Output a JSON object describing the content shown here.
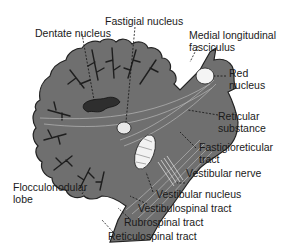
{
  "figure": {
    "type": "anatomical-diagram",
    "colors": {
      "tissue": "#6f6f6f",
      "tissue_dark": "#3a3a3a",
      "outline": "#222222",
      "nucleus_fill": "#f2f2f2",
      "background": "#ffffff",
      "text": "#1a1a1a"
    }
  },
  "labels": {
    "dentate_nucleus": "Dentate nucleus",
    "fastigial_nucleus": "Fastigial nucleus",
    "mlf_line1": "Medial longitudinal",
    "mlf_line2": "fasciculus",
    "red_nucleus_line1": "Red",
    "red_nucleus_line2": "nucleus",
    "reticular_substance_line1": "Reticular",
    "reticular_substance_line2": "substance",
    "fastigioreticular_line1": "Fastigioreticular",
    "fastigioreticular_line2": "tract",
    "vestibular_nerve": "Vestibular nerve",
    "flocculonodular_line1": "Flocculonodular",
    "flocculonodular_line2": "lobe",
    "vestibular_nucleus": "Vestibular nucleus",
    "vestibulospinal_tract": "Vestibulospinal tract",
    "rubrospinal_tract": "Rubrospinal tract",
    "reticulospinal_tract": "Reticulospinal tract"
  }
}
